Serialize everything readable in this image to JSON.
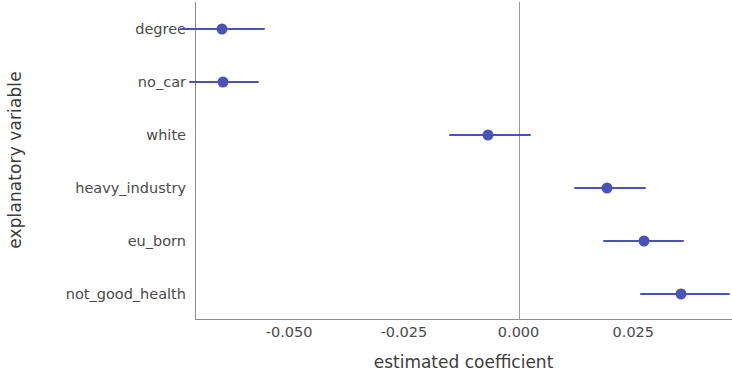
{
  "chart_data": {
    "type": "scatter",
    "title": "",
    "subtitle": "",
    "xlabel": "estimated coefficient",
    "ylabel": "explanatory variable",
    "orientation": "horizontal",
    "grid": false,
    "legend": null,
    "xlim": [
      -0.0705,
      0.0465
    ],
    "xticks": [
      -0.05,
      -0.025,
      0.0,
      0.025
    ],
    "xticklabels": [
      "-0.050",
      "-0.025",
      "0.000",
      "0.025"
    ],
    "reference_line": {
      "x": 0.0,
      "color": "#9a9a9a"
    },
    "marker_color": "#4b52b8",
    "categories": [
      "degree",
      "no_car",
      "white",
      "heavy_industry",
      "eu_born",
      "not_good_health"
    ],
    "points": [
      {
        "label": "degree",
        "estimate": -0.0647,
        "ci_low": -0.0737,
        "ci_high": -0.0552
      },
      {
        "label": "no_car",
        "estimate": -0.0645,
        "ci_low": -0.0718,
        "ci_high": -0.0566
      },
      {
        "label": "white",
        "estimate": -0.0066,
        "ci_low": -0.0152,
        "ci_high": 0.0028
      },
      {
        "label": "heavy_industry",
        "estimate": 0.0192,
        "ci_low": 0.0121,
        "ci_high": 0.0277
      },
      {
        "label": "eu_born",
        "estimate": 0.0273,
        "ci_low": 0.0185,
        "ci_high": 0.036
      },
      {
        "label": "not_good_health",
        "estimate": 0.0353,
        "ci_low": 0.0265,
        "ci_high": 0.046
      }
    ]
  }
}
